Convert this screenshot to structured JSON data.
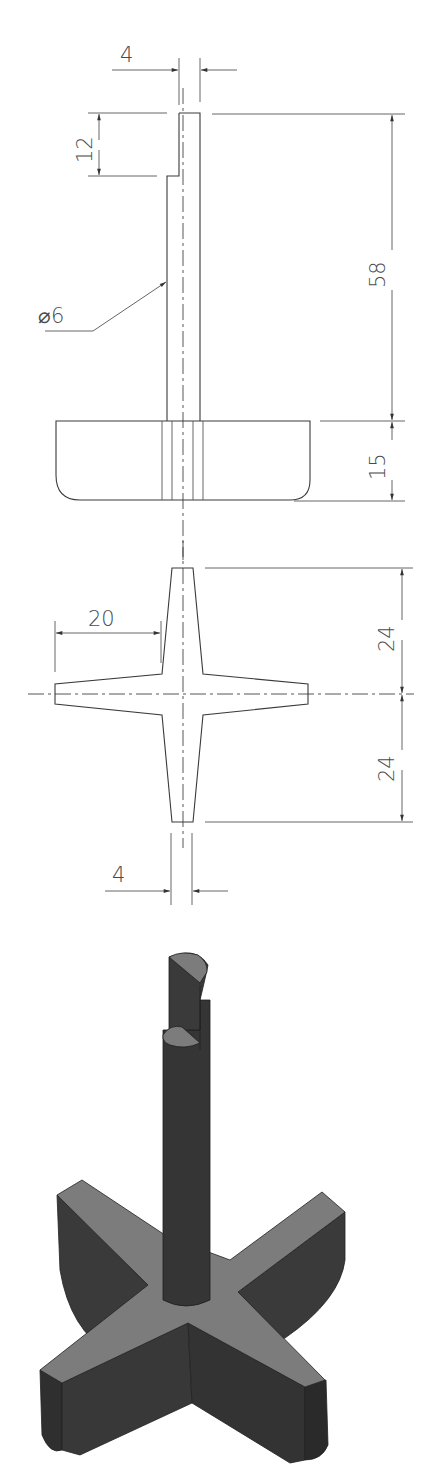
{
  "drawing": {
    "title": "",
    "views": {
      "front_view": {
        "label": "shaft-with-base front view",
        "dimensions": {
          "tenon_width": "4",
          "tenon_height": "12",
          "shaft_length": "58",
          "shaft_diameter": "⌀6",
          "base_height": "15"
        }
      },
      "top_view": {
        "label": "cross base top view",
        "dimensions": {
          "arm_length": "20",
          "upper_half": "24",
          "lower_half": "24",
          "arm_tip_width": "4"
        }
      },
      "isometric_view": {
        "label": "3D rendered part",
        "colors": {
          "body": "#3a3a3a",
          "top_face": "#7c7c7c",
          "background": "#ffffff"
        }
      }
    }
  }
}
